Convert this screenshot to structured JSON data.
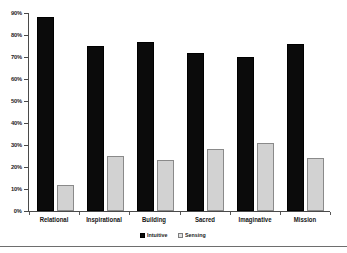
{
  "chart_data": {
    "type": "bar",
    "title": "",
    "xlabel": "",
    "ylabel": "",
    "ylim": [
      0,
      90
    ],
    "grid": false,
    "legend_position": "bottom-center",
    "categories": [
      "Relational",
      "Inspirational",
      "Building",
      "Sacred",
      "Imaginative",
      "Mission"
    ],
    "ytick_labels": [
      "0%",
      "10%",
      "20%",
      "30%",
      "40%",
      "50%",
      "60%",
      "70%",
      "80%",
      "90%"
    ],
    "ytick_values": [
      0,
      10,
      20,
      30,
      40,
      50,
      60,
      70,
      80,
      90
    ],
    "series": [
      {
        "name": "Intuitive",
        "color": "#0b0b0b",
        "values": [
          88,
          75,
          77,
          72,
          70,
          76
        ]
      },
      {
        "name": "Sensing",
        "color": "#d2d2d2",
        "values": [
          12,
          25,
          23,
          28,
          31,
          24
        ]
      }
    ]
  },
  "legend": {
    "items": [
      {
        "label": "Intuitive",
        "swatch": "intuitive"
      },
      {
        "label": "Sensing",
        "swatch": "sensing"
      }
    ]
  }
}
